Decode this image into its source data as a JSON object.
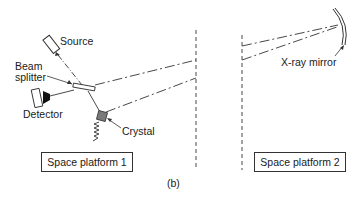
{
  "diagram": {
    "labels": {
      "source": "Source",
      "beam_splitter_line1": "Beam",
      "beam_splitter_line2": "splitter",
      "detector": "Detector",
      "crystal": "Crystal",
      "xray_mirror": "X-ray mirror",
      "caption": "(b)"
    },
    "platforms": [
      {
        "label": "Space platform 1"
      },
      {
        "label": "Space platform 2"
      }
    ],
    "colors": {
      "line": "#333333",
      "crystal_fill": "#7a7a7a",
      "detector_cone": "#111111"
    }
  }
}
